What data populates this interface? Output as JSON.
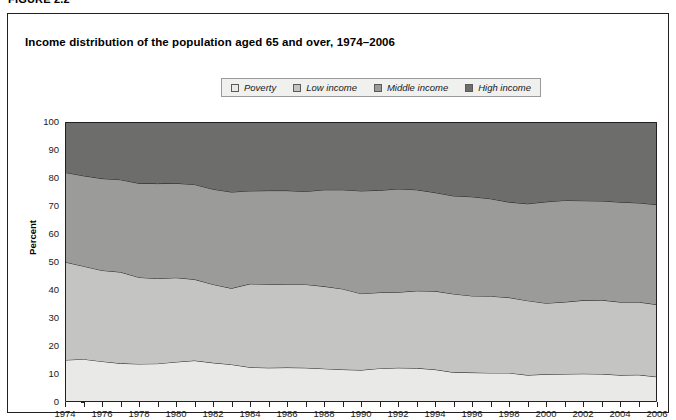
{
  "figure": {
    "label": "FIGURE 2.2",
    "title": "Income distribution of the population aged 65 and over, 1974–2006"
  },
  "legend": {
    "items": [
      {
        "label": "Poverty",
        "color": "#e9e9e7"
      },
      {
        "label": "Low income",
        "color": "#c4c4c2"
      },
      {
        "label": "Middle income",
        "color": "#9b9b99"
      },
      {
        "label": "High income",
        "color": "#6d6d6b"
      }
    ]
  },
  "chart_data": {
    "type": "area",
    "title": "Income distribution of the population aged 65 and over, 1974–2006",
    "xlabel": "",
    "ylabel": "Percent",
    "ylim": [
      0,
      100
    ],
    "yticks": [
      0,
      10,
      20,
      30,
      40,
      50,
      60,
      70,
      80,
      90,
      100
    ],
    "xlim": [
      1974,
      2006
    ],
    "xticks": [
      1974,
      1976,
      1978,
      1980,
      1982,
      1984,
      1986,
      1988,
      1990,
      1992,
      1994,
      1996,
      1998,
      2000,
      2002,
      2004,
      2006
    ],
    "grid": false,
    "stacked": true,
    "legend_position": "top-center",
    "x": [
      1974,
      1975,
      1976,
      1977,
      1978,
      1979,
      1980,
      1981,
      1982,
      1983,
      1984,
      1985,
      1986,
      1987,
      1988,
      1989,
      1990,
      1991,
      1992,
      1993,
      1994,
      1995,
      1996,
      1997,
      1998,
      1999,
      2000,
      2001,
      2002,
      2003,
      2004,
      2005,
      2006
    ],
    "series": [
      {
        "name": "Poverty",
        "color": "#e9e9e7",
        "values": [
          15.0,
          15.3,
          14.5,
          13.8,
          13.6,
          13.7,
          14.3,
          14.8,
          14.0,
          13.4,
          12.4,
          12.2,
          12.3,
          12.2,
          11.9,
          11.6,
          11.4,
          12.0,
          12.2,
          12.1,
          11.6,
          10.6,
          10.5,
          10.4,
          10.4,
          9.6,
          9.9,
          10.0,
          10.1,
          10.0,
          9.6,
          9.7,
          9.0
        ]
      },
      {
        "name": "Low income",
        "color": "#c4c4c2",
        "values": [
          35.0,
          33.2,
          32.5,
          32.6,
          30.9,
          30.4,
          30.1,
          29.0,
          28.0,
          27.2,
          29.8,
          29.9,
          29.7,
          29.8,
          29.4,
          28.8,
          27.3,
          27.1,
          27.0,
          27.6,
          28.0,
          28.0,
          27.4,
          27.4,
          26.9,
          26.6,
          25.4,
          25.7,
          26.2,
          26.4,
          26.1,
          26.0,
          25.8
        ]
      },
      {
        "name": "Middle income",
        "color": "#9b9b99",
        "values": [
          32.0,
          32.3,
          32.8,
          33.0,
          33.6,
          33.9,
          33.7,
          33.9,
          34.0,
          34.4,
          33.2,
          33.4,
          33.5,
          33.2,
          34.5,
          35.4,
          36.7,
          36.5,
          36.9,
          36.1,
          35.2,
          35.0,
          35.4,
          34.8,
          34.1,
          34.6,
          36.2,
          36.3,
          35.6,
          35.4,
          35.7,
          35.4,
          35.7
        ]
      },
      {
        "name": "High income",
        "color": "#6d6d6b",
        "values": [
          18.0,
          19.2,
          20.2,
          20.6,
          21.9,
          22.0,
          21.9,
          22.3,
          24.0,
          25.0,
          24.6,
          24.5,
          24.5,
          24.8,
          24.2,
          24.2,
          24.6,
          24.4,
          23.9,
          24.2,
          25.2,
          26.4,
          26.7,
          27.4,
          28.6,
          29.2,
          28.5,
          28.0,
          28.1,
          28.2,
          28.6,
          28.9,
          29.5
        ]
      }
    ]
  }
}
